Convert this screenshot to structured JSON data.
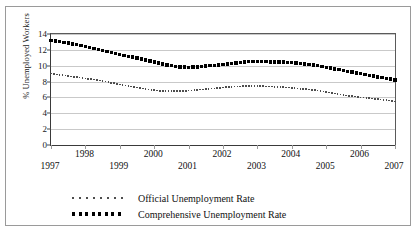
{
  "chart_data": {
    "type": "line",
    "title": "",
    "xlabel": "",
    "ylabel": "% Unemployed Workers",
    "ylim": [
      0,
      14
    ],
    "xlim": [
      1997,
      2007
    ],
    "yticks": [
      0,
      2,
      4,
      6,
      8,
      10,
      12,
      14
    ],
    "ytick_labels": [
      "0",
      "2",
      "4",
      "6",
      "8",
      "10",
      "12",
      "14"
    ],
    "xticks": [
      1997,
      1998,
      1999,
      2000,
      2001,
      2002,
      2003,
      2004,
      2005,
      2006,
      2007
    ],
    "xtick_labels": [
      "1997",
      "1998",
      "1999",
      "2000",
      "2001",
      "2002",
      "2003",
      "2004",
      "2005",
      "2006",
      "2007"
    ],
    "grid": true,
    "legend_position": "bottom",
    "marker_style": "dotted",
    "x": [
      1997,
      1997.25,
      1997.5,
      1997.75,
      1998,
      1998.25,
      1998.5,
      1998.75,
      1999,
      1999.25,
      1999.5,
      1999.75,
      2000,
      2000.25,
      2000.5,
      2000.75,
      2001,
      2001.25,
      2001.5,
      2001.75,
      2002,
      2002.25,
      2002.5,
      2002.75,
      2003,
      2003.25,
      2003.5,
      2003.75,
      2004,
      2004.25,
      2004.5,
      2004.75,
      2005,
      2005.25,
      2005.5,
      2005.75,
      2006,
      2006.25,
      2006.5,
      2006.75,
      2007
    ],
    "series": [
      {
        "name": "Official Unemployment Rate",
        "color": "#4d4d4d",
        "values": [
          9.0,
          8.85,
          8.7,
          8.55,
          8.4,
          8.25,
          8.05,
          7.85,
          7.65,
          7.45,
          7.25,
          7.05,
          6.9,
          6.8,
          6.8,
          6.8,
          6.85,
          6.95,
          7.05,
          7.15,
          7.25,
          7.35,
          7.4,
          7.45,
          7.45,
          7.4,
          7.35,
          7.3,
          7.2,
          7.1,
          7.0,
          6.85,
          6.7,
          6.5,
          6.3,
          6.15,
          6.0,
          5.9,
          5.8,
          5.65,
          5.5
        ]
      },
      {
        "name": "Comprehensive Unemployment Rate",
        "color": "#000000",
        "values": [
          13.2,
          13.05,
          12.85,
          12.65,
          12.45,
          12.2,
          11.95,
          11.7,
          11.45,
          11.2,
          10.95,
          10.7,
          10.45,
          10.2,
          10.0,
          9.85,
          9.8,
          9.85,
          9.95,
          10.05,
          10.15,
          10.25,
          10.4,
          10.5,
          10.55,
          10.5,
          10.45,
          10.45,
          10.4,
          10.3,
          10.15,
          10.0,
          9.8,
          9.6,
          9.4,
          9.2,
          9.0,
          8.8,
          8.6,
          8.4,
          8.2
        ]
      }
    ]
  },
  "legend": {
    "items": [
      {
        "label": "Official Unemployment Rate",
        "style": "fine-dotted"
      },
      {
        "label": "Comprehensive Unemployment Rate",
        "style": "bold-dotted"
      }
    ]
  },
  "source_note": ""
}
